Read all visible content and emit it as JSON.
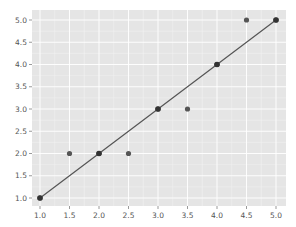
{
  "chart_data": {
    "type": "scatter",
    "title": "",
    "xlabel": "",
    "ylabel": "",
    "xlim": [
      0.9,
      5.18
    ],
    "ylim": [
      0.8,
      5.2
    ],
    "grid": true,
    "style": "ggplot",
    "x_ticks": [
      "1.0",
      "1.5",
      "2.0",
      "2.5",
      "3.0",
      "3.5",
      "4.0",
      "4.5",
      "5.0"
    ],
    "y_ticks": [
      "1.0",
      "1.5",
      "2.0",
      "2.5",
      "3.0",
      "3.5",
      "4.0",
      "4.5",
      "5.0"
    ],
    "series": [
      {
        "name": "observed",
        "type": "scatter",
        "color": "#555555",
        "points": [
          [
            1.0,
            1.0
          ],
          [
            1.5,
            2.0
          ],
          [
            2.0,
            2.0
          ],
          [
            2.5,
            2.0
          ],
          [
            3.0,
            3.0
          ],
          [
            3.5,
            3.0
          ],
          [
            4.0,
            4.0
          ],
          [
            4.5,
            5.0
          ],
          [
            5.0,
            5.0
          ]
        ]
      },
      {
        "name": "fit",
        "type": "line",
        "color": "#555555",
        "marker_color": "#333333",
        "points": [
          [
            1.0,
            1.0
          ],
          [
            2.0,
            2.0
          ],
          [
            3.0,
            3.0
          ],
          [
            4.0,
            4.0
          ],
          [
            5.0,
            5.0
          ]
        ]
      }
    ],
    "legend": null
  },
  "colors": {
    "plot_background": "#e5e5e5",
    "grid_major": "#ffffff",
    "grid_minor": "#f2f2f2",
    "tick_label": "#555555"
  }
}
